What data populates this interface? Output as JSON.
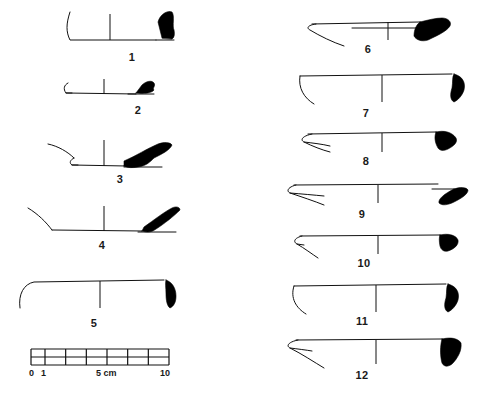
{
  "plate": {
    "title": "Pottery vessel profile plate",
    "description": "Archaeological line drawings of twelve ceramic rim profiles arranged in two columns with a centimetre scale bar.",
    "background_color": "#ffffff",
    "ink_color": "#111111",
    "fill_color": "#000000",
    "total_figures": 12
  },
  "columns": [
    {
      "name": "left-column",
      "figure_numbers": [
        "1",
        "2",
        "3",
        "4",
        "5"
      ]
    },
    {
      "name": "right-column",
      "figure_numbers": [
        "6",
        "7",
        "8",
        "9",
        "10",
        "11",
        "12"
      ]
    }
  ],
  "figures": [
    {
      "number": "1",
      "label": "1",
      "column": "left",
      "x": 48,
      "y": 8,
      "w": 130,
      "h": 48,
      "label_x": 84,
      "label_y": 44,
      "profile_type": "deep-bowl-steep-wall",
      "outline_path": "M 22 4 C 18 16 18 24 22 32 L 108 32",
      "axis_x": 62,
      "axis_y1": 6,
      "axis_y2": 32,
      "rim_fill_path": "M 114 30 L 110 14 C 112 6 120 2 124 4 C 127 8 124 18 126 22 C 127 27 126 30 124 31 Z",
      "rim_baseline": "M 108 32 L 126 32"
    },
    {
      "number": "2",
      "label": "2",
      "column": "left",
      "x": 58,
      "y": 75,
      "w": 112,
      "h": 38,
      "label_x": 80,
      "label_y": 30,
      "profile_type": "shallow-dish-everted",
      "outline_path": "M 10 8 C 6 10 5 14 8 18 L 14 18 M 8 18 L 78 19",
      "axis_x": 46,
      "axis_y1": 4,
      "axis_y2": 19,
      "rim_fill_path": "M 78 18 L 84 10 C 88 6 94 5 96 8 C 98 11 94 13 96 15 C 94 18 86 19 78 18 Z",
      "rim_baseline": "M 70 19 L 96 19"
    },
    {
      "number": "3",
      "label": "3",
      "column": "left",
      "x": 38,
      "y": 132,
      "w": 134,
      "h": 52,
      "label_x": 82,
      "label_y": 42,
      "profile_type": "flanged-rim-platter",
      "outline_path": "M 10 12 C 20 14 30 20 36 26 M 36 26 C 32 28 31 31 34 33 L 40 33 M 34 33 L 88 34",
      "axis_x": 66,
      "axis_y1": 8,
      "axis_y2": 34,
      "rim_fill_path": "M 86 34 L 86 29 C 98 24 110 16 120 12 C 126 10 132 10 134 13 C 132 18 124 22 116 26 C 112 30 108 34 100 35 C 94 36 90 36 86 34 Z",
      "rim_baseline": "M 86 35 L 124 35"
    },
    {
      "number": "4",
      "label": "4",
      "column": "left",
      "x": 20,
      "y": 200,
      "w": 156,
      "h": 50,
      "label_x": 82,
      "label_y": 40,
      "profile_type": "wide-flat-platter-upturned-rim",
      "outline_path": "M 8 8 C 18 14 26 22 32 30 M 32 30 L 122 31",
      "axis_x": 84,
      "axis_y1": 6,
      "axis_y2": 31,
      "rim_fill_path": "M 122 31 L 124 27 C 134 20 144 12 152 8 C 156 6 160 7 160 10 C 154 16 144 24 136 29 C 132 32 128 33 122 31 Z",
      "rim_baseline": "M 118 32 L 156 32"
    },
    {
      "number": "5",
      "label": "5",
      "column": "left",
      "x": 12,
      "y": 272,
      "w": 176,
      "h": 56,
      "label_x": 82,
      "label_y": 46,
      "profile_type": "large-shallow-basin",
      "outline_path": "M 8 36 C 6 22 12 12 22 10 L 152 8",
      "axis_x": 88,
      "axis_y1": 9,
      "axis_y2": 36,
      "rim_fill_path": "M 154 8 C 160 10 164 16 164 24 C 164 30 162 34 158 36 C 155 34 154 28 154 22 C 154 16 153 11 154 8 Z",
      "rim_baseline": ""
    },
    {
      "number": "6",
      "label": "6",
      "column": "right",
      "x": 300,
      "y": 10,
      "w": 176,
      "h": 48,
      "label_x": 68,
      "label_y": 34,
      "profile_type": "inturned-rim-bowl-beaded",
      "outline_path": "M 16 14 C 8 15 6 18 10 20 C 20 26 32 32 44 36 M 12 14 L 120 12 M 52 18 L 120 18",
      "axis_x": 88,
      "axis_y1": 12,
      "axis_y2": 30,
      "rim_fill_path": "M 120 12 C 128 10 136 8 142 8 C 148 8 152 12 150 16 C 146 22 136 26 128 30 C 122 32 116 30 114 26 C 114 20 116 15 120 12 Z",
      "rim_baseline": ""
    },
    {
      "number": "7",
      "label": "7",
      "column": "right",
      "x": 292,
      "y": 66,
      "w": 188,
      "h": 52,
      "label_x": 74,
      "label_y": 42,
      "profile_type": "deep-basin-rounded-wall",
      "outline_path": "M 8 10 C 6 22 12 32 22 38 M 8 10 L 160 8",
      "axis_x": 90,
      "axis_y1": 9,
      "axis_y2": 36,
      "rim_fill_path": "M 162 8 C 170 10 174 16 172 24 C 170 30 166 34 162 36 C 158 34 158 28 160 22 C 161 16 160 11 162 8 Z",
      "rim_baseline": ""
    },
    {
      "number": "8",
      "label": "8",
      "column": "right",
      "x": 294,
      "y": 122,
      "w": 186,
      "h": 46,
      "label_x": 72,
      "label_y": 34,
      "profile_type": "everted-rim-dish-pointed",
      "outline_path": "M 18 12 C 8 14 6 18 10 20 C 18 24 28 28 36 30 M 10 20 C 18 21 28 22 36 24 M 14 12 L 142 10",
      "axis_x": 88,
      "axis_y1": 11,
      "axis_y2": 30,
      "rim_fill_path": "M 142 10 C 150 8 158 10 162 16 C 164 20 160 24 154 27 C 150 29 146 29 144 26 C 141 21 140 15 142 10 Z",
      "rim_baseline": ""
    },
    {
      "number": "9",
      "label": "9",
      "column": "right",
      "x": 282,
      "y": 175,
      "w": 198,
      "h": 48,
      "label_x": 80,
      "label_y": 34,
      "profile_type": "flat-platter-tapered-rim",
      "outline_path": "M 14 10 C 6 12 4 16 8 18 C 20 22 32 26 42 30 M 8 18 C 20 19 32 20 42 21 M 12 10 L 156 9 M 150 14 L 172 14",
      "axis_x": 96,
      "axis_y1": 10,
      "axis_y2": 28,
      "rim_fill_path": "M 172 14 C 178 12 184 12 186 15 C 186 19 180 23 172 27 C 166 30 160 31 157 28 C 156 24 162 19 172 14 Z",
      "rim_baseline": ""
    },
    {
      "number": "10",
      "label": "10",
      "column": "right",
      "x": 288,
      "y": 226,
      "w": 190,
      "h": 46,
      "label_x": 76,
      "label_y": 32,
      "profile_type": "shallow-dish-hooked-rim",
      "outline_path": "M 14 10 C 6 12 5 16 9 18 C 16 22 24 28 30 32 M 9 18 L 16 19 M 12 10 L 152 9",
      "axis_x": 90,
      "axis_y1": 10,
      "axis_y2": 28,
      "rim_fill_path": "M 152 9 C 160 7 168 9 170 14 C 171 19 166 23 160 25 C 156 26 153 24 152 20 C 151 15 151 11 152 9 Z",
      "rim_baseline": ""
    },
    {
      "number": "11",
      "label": "11",
      "column": "right",
      "x": 284,
      "y": 276,
      "w": 194,
      "h": 50,
      "label_x": 78,
      "label_y": 40,
      "profile_type": "basin-rounded-wall-thick-rim",
      "outline_path": "M 10 10 C 6 22 12 32 22 38 M 10 10 L 162 8",
      "axis_x": 92,
      "axis_y1": 9,
      "axis_y2": 36,
      "rim_fill_path": "M 164 8 C 172 10 176 16 174 24 C 172 30 168 34 164 36 C 160 34 160 28 162 22 C 163 16 162 11 164 8 Z",
      "rim_baseline": ""
    },
    {
      "number": "12",
      "label": "12",
      "column": "right",
      "x": 282,
      "y": 330,
      "w": 196,
      "h": 52,
      "label_x": 80,
      "label_y": 40,
      "profile_type": "platter-pointed-everted-rim",
      "outline_path": "M 16 10 C 6 12 4 16 8 18 C 20 24 32 32 42 38 M 8 18 C 16 19 24 20 30 21 M 14 10 L 160 9",
      "axis_x": 94,
      "axis_y1": 10,
      "axis_y2": 34,
      "rim_fill_path": "M 160 9 C 168 7 176 8 179 13 C 180 20 176 28 170 34 C 166 37 162 37 160 33 C 158 26 158 16 160 9 Z",
      "rim_baseline": ""
    }
  ],
  "scale_bar": {
    "name": "scale-bar",
    "x": 30,
    "y": 348,
    "width": 138,
    "height": 16,
    "segments": 7,
    "unit": "cm",
    "min": 0,
    "max": 10,
    "ticks": [
      {
        "label": "0",
        "value": 0,
        "x": 0
      },
      {
        "label": "1",
        "value": 1,
        "x": 14
      },
      {
        "label": "5 cm",
        "value": 5,
        "x": 69
      },
      {
        "label": "10",
        "value": 10,
        "x": 138
      }
    ]
  }
}
